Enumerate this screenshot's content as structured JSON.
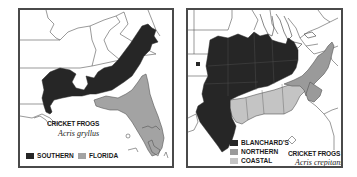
{
  "maps": [
    {
      "title": "CRICKET FROGS",
      "species": "Acris gryllus",
      "legend": [
        {
          "label": "SOUTHERN",
          "color": "#262626"
        },
        {
          "label": "FLORIDA",
          "color": "#a3a3a3"
        }
      ]
    },
    {
      "title": "CRICKET FROGS",
      "species": "Acris crepitans",
      "legend": [
        {
          "label": "BLANCHARD'S",
          "color": "#262626"
        },
        {
          "label": "NORTHERN",
          "color": "#9a9a9a"
        },
        {
          "label": "COASTAL",
          "color": "#c4c4c4"
        }
      ]
    }
  ],
  "colors": {
    "frame": "#4a4a4a",
    "border_lines": "#555555",
    "background": "#ffffff"
  }
}
